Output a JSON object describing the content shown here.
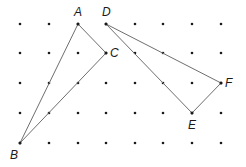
{
  "diagram": {
    "type": "dot-grid-triangles",
    "grid": {
      "columns_x": [
        20,
        49,
        78,
        106,
        135,
        163,
        192,
        221
      ],
      "rows_y": [
        24,
        53,
        83,
        113,
        143
      ],
      "dot_color": "#1a1a1a"
    },
    "points": [
      {
        "name": "A",
        "col": 2,
        "row": 0,
        "label_dx": -4,
        "label_dy": -8
      },
      {
        "name": "B",
        "col": 0,
        "row": 4,
        "label_dx": -10,
        "label_dy": 16
      },
      {
        "name": "C",
        "col": 3,
        "row": 1,
        "label_dx": 4,
        "label_dy": 4
      },
      {
        "name": "D",
        "col": 3,
        "row": 0,
        "label_dx": -4,
        "label_dy": -8
      },
      {
        "name": "E",
        "col": 6,
        "row": 3,
        "label_dx": -4,
        "label_dy": 16
      },
      {
        "name": "F",
        "col": 7,
        "row": 2,
        "label_dx": 4,
        "label_dy": 4
      }
    ],
    "shapes": [
      {
        "name": "triangle-ABC",
        "vertices": [
          "A",
          "B",
          "C"
        ]
      },
      {
        "name": "triangle-DEF",
        "vertices": [
          "D",
          "E",
          "F"
        ]
      }
    ],
    "edge_color": "#6e6e6e"
  }
}
